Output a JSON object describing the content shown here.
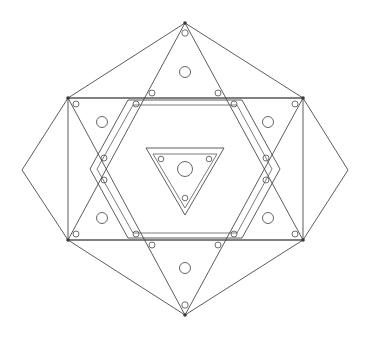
{
  "diagram": {
    "type": "geometric-line-drawing",
    "canvas": {
      "width": 371,
      "height": 340
    },
    "center": {
      "x": 185,
      "y": 169
    },
    "colors": {
      "background": "#ffffff",
      "line": "#4a4a4a",
      "line_soft": "#5a5a5a",
      "hole": "#555555",
      "vertex": "#3a3a3a"
    },
    "stroke_width": 0.9
  },
  "shapes": {
    "outer_hexagon": {
      "name": "outer-hexagon",
      "sides": 6,
      "orientation": "flat-left-right-points",
      "points": "185,23 303,98 348,170 303,240 185,315 68,240 22,170 68,98",
      "vertices": [
        {
          "x": 185,
          "y": 23
        },
        {
          "x": 303,
          "y": 98
        },
        {
          "x": 348,
          "y": 170
        },
        {
          "x": 303,
          "y": 240
        },
        {
          "x": 185,
          "y": 315
        },
        {
          "x": 68,
          "y": 240
        },
        {
          "x": 22,
          "y": 170
        },
        {
          "x": 68,
          "y": 98
        }
      ]
    },
    "inner_rectangle": {
      "name": "inner-rectangle-frame",
      "points": "68,98 303,98 303,240 68,240"
    },
    "hexagram_triangle_up": {
      "name": "hexagram-triangle-up",
      "points": "185,23 303,240 68,240"
    },
    "hexagram_triangle_down": {
      "name": "hexagram-triangle-down",
      "points": "185,315 68,98 303,98"
    },
    "mid_hexagon_outer": {
      "name": "mid-hexagon-outer",
      "points": "128,100 242,100 280,169 242,238 128,238 90,169"
    },
    "mid_hexagon_inner": {
      "name": "mid-hexagon-inner",
      "points": "133,105 237,105 272,169 237,233 133,233 97,169"
    },
    "core_triangle_outer": {
      "name": "core-triangle-outer",
      "points": "146,148 224,148 185,215"
    },
    "core_triangle_inner": {
      "name": "core-triangle-inner",
      "points": "153,154 217,154 185,208"
    }
  },
  "circles": {
    "center_hole": {
      "name": "center-hole",
      "cx": 185,
      "cy": 169,
      "r": 7.5
    },
    "field_holes": [
      {
        "name": "field-hole-top",
        "cx": 185,
        "cy": 72,
        "r": 5.5
      },
      {
        "name": "field-hole-upper-left",
        "cx": 102,
        "cy": 122,
        "r": 5.5
      },
      {
        "name": "field-hole-upper-right",
        "cx": 268,
        "cy": 122,
        "r": 5.5
      },
      {
        "name": "field-hole-lower-left",
        "cx": 102,
        "cy": 218,
        "r": 5.5
      },
      {
        "name": "field-hole-lower-right",
        "cx": 268,
        "cy": 218,
        "r": 5.5
      },
      {
        "name": "field-hole-bottom",
        "cx": 185,
        "cy": 268,
        "r": 5.5
      }
    ],
    "bolt_holes": [
      {
        "name": "bolt-hole-apex-top",
        "cx": 185,
        "cy": 33,
        "r": 3.2
      },
      {
        "name": "bolt-hole-apex-bottom",
        "cx": 185,
        "cy": 305,
        "r": 3.2
      },
      {
        "name": "bolt-hole-corner-tl",
        "cx": 76,
        "cy": 104,
        "r": 3.0
      },
      {
        "name": "bolt-hole-corner-tr",
        "cx": 295,
        "cy": 104,
        "r": 3.0
      },
      {
        "name": "bolt-hole-corner-bl",
        "cx": 76,
        "cy": 234,
        "r": 3.0
      },
      {
        "name": "bolt-hole-corner-br",
        "cx": 295,
        "cy": 234,
        "r": 3.0
      },
      {
        "name": "bolt-hole-edge-top-left",
        "cx": 136,
        "cy": 104,
        "r": 3.0
      },
      {
        "name": "bolt-hole-edge-top-right",
        "cx": 234,
        "cy": 104,
        "r": 3.0
      },
      {
        "name": "bolt-hole-edge-bot-left",
        "cx": 136,
        "cy": 234,
        "r": 3.0
      },
      {
        "name": "bolt-hole-edge-bot-right",
        "cx": 234,
        "cy": 234,
        "r": 3.0
      },
      {
        "name": "bolt-hole-upper-left-in",
        "cx": 152,
        "cy": 93,
        "r": 3.0
      },
      {
        "name": "bolt-hole-upper-right-in",
        "cx": 218,
        "cy": 93,
        "r": 3.0
      },
      {
        "name": "bolt-hole-lower-left-in",
        "cx": 152,
        "cy": 245,
        "r": 3.0
      },
      {
        "name": "bolt-hole-lower-right-in",
        "cx": 218,
        "cy": 245,
        "r": 3.0
      },
      {
        "name": "bolt-hole-left-upper",
        "cx": 104,
        "cy": 158,
        "r": 3.0
      },
      {
        "name": "bolt-hole-left-lower",
        "cx": 104,
        "cy": 180,
        "r": 3.0
      },
      {
        "name": "bolt-hole-right-upper",
        "cx": 266,
        "cy": 158,
        "r": 3.0
      },
      {
        "name": "bolt-hole-right-lower",
        "cx": 266,
        "cy": 180,
        "r": 3.0
      },
      {
        "name": "bolt-hole-core-left",
        "cx": 161,
        "cy": 159,
        "r": 2.8
      },
      {
        "name": "bolt-hole-core-right",
        "cx": 209,
        "cy": 159,
        "r": 2.8
      },
      {
        "name": "bolt-hole-core-bottom",
        "cx": 185,
        "cy": 198,
        "r": 2.8
      }
    ],
    "vertex_markers": [
      {
        "name": "vertex-marker-top",
        "cx": 185,
        "cy": 23,
        "r": 1.8
      },
      {
        "name": "vertex-marker-bottom",
        "cx": 185,
        "cy": 315,
        "r": 1.8
      },
      {
        "name": "vertex-marker-tl",
        "cx": 68,
        "cy": 98,
        "r": 1.8
      },
      {
        "name": "vertex-marker-tr",
        "cx": 303,
        "cy": 98,
        "r": 1.8
      },
      {
        "name": "vertex-marker-bl",
        "cx": 68,
        "cy": 240,
        "r": 1.8
      },
      {
        "name": "vertex-marker-br",
        "cx": 303,
        "cy": 240,
        "r": 1.8
      }
    ]
  }
}
